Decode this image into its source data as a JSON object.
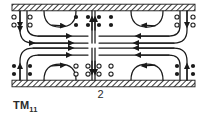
{
  "figure": {
    "kind": "waveguide-field-pattern",
    "mode_label": "TM",
    "mode_subscript": "11",
    "figure_number": "2",
    "caption_position": "below",
    "colors": {
      "ink": "#1a1a1a",
      "background": "#ffffff",
      "wall_hatch": "#1a1a1a",
      "field_line": "#1a1a1a"
    },
    "walls": [
      {
        "name": "top-conducting-wall",
        "x": 12,
        "y": 4,
        "width": 183,
        "height": 7,
        "hatch": "diagonal"
      },
      {
        "name": "bottom-conducting-wall",
        "x": 12,
        "y": 80,
        "width": 183,
        "height": 7,
        "hatch": "diagonal"
      }
    ],
    "legend": {
      "filled_dot": "field-out-of-page",
      "open_circle": "field-into-page"
    },
    "marker_groups": [
      {
        "name": "top-left-open-circles",
        "symbol": "open-circle",
        "count": 4
      },
      {
        "name": "top-center-left-filled-dots",
        "symbol": "filled-dot",
        "count": 4
      },
      {
        "name": "top-center-right-filled-dots",
        "symbol": "filled-dot",
        "count": 4
      },
      {
        "name": "top-right-open-circles",
        "symbol": "open-circle",
        "count": 4
      },
      {
        "name": "bottom-left-filled-dots",
        "symbol": "filled-dot",
        "count": 4
      },
      {
        "name": "bottom-center-left-open-circles",
        "symbol": "open-circle",
        "count": 4
      },
      {
        "name": "bottom-center-right-open-circles",
        "symbol": "open-circle",
        "count": 4
      },
      {
        "name": "bottom-right-filled-dots",
        "symbol": "filled-dot",
        "count": 4
      }
    ],
    "field_lines": {
      "count": 12,
      "arrowheads": 12,
      "description": "closed electric field loops, upper and lower cells, mirrored left-right"
    }
  }
}
